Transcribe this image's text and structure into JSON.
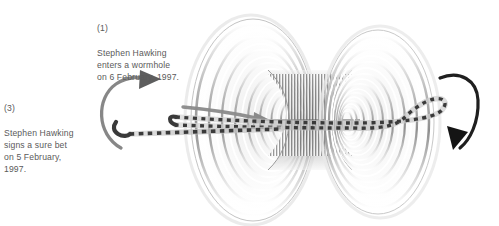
{
  "figure": {
    "background_color": "#ffffff"
  },
  "annotations": [
    {
      "id": "annotation-entry",
      "name": "annotation-hawking-enters-wormhole",
      "index": "(1)",
      "body": "Stephen Hawking\nenters a wormhole\non 6 February, 1997.",
      "color": "#5a5a5a"
    },
    {
      "id": "annotation-bet",
      "name": "annotation-hawking-signs-bet",
      "index": "(3)",
      "body": "Stephen Hawking\nsigns a sure bet\non 5 February,\n1997.",
      "color": "#5a5a5a"
    }
  ],
  "diagram": {
    "left_mouth_label": "left-wormhole-mouth",
    "right_mouth_label": "right-wormhole-mouth",
    "throat_label": "wormhole-throat",
    "left_rotation_arrow_label": "left-rotation-arrow",
    "right_rotation_arrow_label": "right-rotation-arrow",
    "worldline_label": "dashed-worldline",
    "direction_arrow_label": "travel-direction-arrow",
    "colors": {
      "ring_dark": "#8c8c8c",
      "ring_mid": "#b4b4b4",
      "ring_light": "#e3e3e3",
      "arrow_left": "#6e6e6e",
      "arrow_right": "#1f1f1f",
      "worldline_dash": "#3a3a3a",
      "worldline_band": "#c9c9c9",
      "text": "#5a5a5a"
    }
  }
}
